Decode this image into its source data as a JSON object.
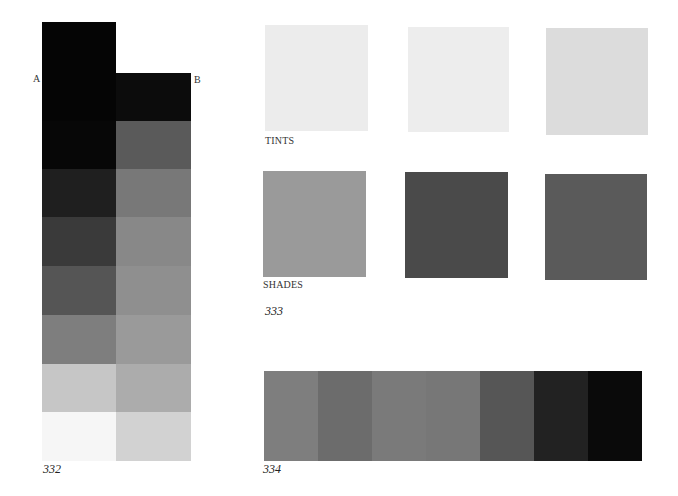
{
  "figure_332": {
    "number": "332",
    "column_a": {
      "label": "A",
      "cells": [
        "#050505",
        "#070707",
        "#1f1f1f",
        "#3a3a3a",
        "#555555",
        "#7e7e7e",
        "#c6c6c6",
        "#f6f6f6"
      ]
    },
    "column_b": {
      "label": "B",
      "cells": [
        "#0c0c0c",
        "#5a5a5a",
        "#787878",
        "#888888",
        "#8f8f8f",
        "#9a9a9a",
        "#acacac",
        "#d2d2d2"
      ]
    }
  },
  "figure_333": {
    "number": "333",
    "tints": {
      "label": "TINTS",
      "swatches": [
        "#ececec",
        "#ededed",
        "#dcdcdc"
      ]
    },
    "shades": {
      "label": "SHADES",
      "swatches": [
        "#9a9a9a",
        "#4a4a4a",
        "#5a5a5a"
      ]
    }
  },
  "figure_334": {
    "number": "334",
    "strip": [
      "#7e7e7e",
      "#6c6c6c",
      "#7a7a7a",
      "#777777",
      "#565656",
      "#222222",
      "#0a0a0a"
    ]
  }
}
